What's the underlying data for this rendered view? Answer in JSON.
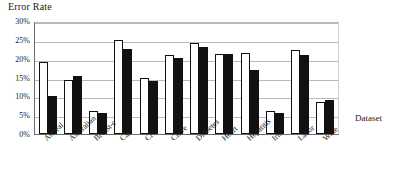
{
  "chart_data": {
    "type": "bar",
    "title": "Error Rate",
    "xlabel": "Dataset",
    "ylabel": "Error Rate",
    "ylim": [
      0,
      30
    ],
    "ytick_labels": [
      "30%",
      "25%",
      "20%",
      "15%",
      "10%",
      "5%",
      "0%"
    ],
    "ytick_values": [
      30,
      25,
      20,
      15,
      10,
      5,
      0
    ],
    "grid": true,
    "legend": null,
    "categories": [
      "Anneal",
      "Australian",
      "Breast-c",
      "Car",
      "Crx",
      "Cleve",
      "Diabetes",
      "Heart",
      "Hepatitis",
      "Iris",
      "Labor",
      "Wine"
    ],
    "series": [
      {
        "name": "Series 1",
        "color": "#ffffff",
        "values": [
          19.0,
          14.4,
          6.1,
          25.0,
          15.0,
          21.0,
          24.2,
          21.2,
          21.6,
          6.1,
          22.2,
          8.5
        ]
      },
      {
        "name": "Series 2",
        "color": "#111111",
        "values": [
          10.0,
          15.4,
          5.6,
          22.5,
          14.0,
          20.3,
          23.2,
          21.2,
          17.0,
          5.6,
          21.0,
          9.0
        ]
      }
    ]
  },
  "axis": {
    "y_title": "Error Rate",
    "x_title": "Dataset"
  }
}
